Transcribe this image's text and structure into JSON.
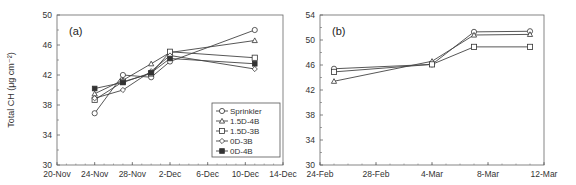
{
  "chart_data": [
    {
      "type": "line",
      "panel_label": "(a)",
      "title": "",
      "xlabel": "",
      "ylabel": "Total CH (μg cm⁻²)",
      "ylim": [
        30,
        50
      ],
      "yticks": [
        30,
        34,
        38,
        42,
        46,
        50
      ],
      "xtick_labels": [
        "20-Nov",
        "24-Nov",
        "28-Nov",
        "2-Dec",
        "6-Dec",
        "10-Dec",
        "14-Dec"
      ],
      "x_range_days": [
        0,
        24
      ],
      "x": [
        "24-Nov",
        "27-Nov",
        "1-Dec",
        "2-Dec",
        "11-Dec"
      ],
      "x_days": [
        4,
        7,
        10,
        12,
        21
      ],
      "grid": false,
      "legend_position": "lower right",
      "series": [
        {
          "name": "Sprinkler",
          "marker": "circle",
          "values": [
            36.9,
            42.0,
            41.7,
            43.8,
            48.0
          ]
        },
        {
          "name": "1.5D-4B",
          "marker": "triangle",
          "values": [
            39.5,
            41.3,
            43.5,
            45.0,
            46.6
          ]
        },
        {
          "name": "1.5D-3B",
          "marker": "square",
          "values": [
            38.7,
            41.1,
            42.2,
            45.1,
            44.3
          ]
        },
        {
          "name": "0D-3B",
          "marker": "diamond",
          "values": [
            38.9,
            40.0,
            42.5,
            44.6,
            42.8
          ]
        },
        {
          "name": "0D-4B",
          "marker": "filled-square",
          "values": [
            40.2,
            41.0,
            42.3,
            44.2,
            43.5
          ]
        }
      ]
    },
    {
      "type": "line",
      "panel_label": "(b)",
      "title": "",
      "xlabel": "",
      "ylabel": "",
      "ylim": [
        30,
        54
      ],
      "yticks": [
        30,
        34,
        38,
        42,
        46,
        50,
        54
      ],
      "xtick_labels": [
        "24-Feb",
        "28-Feb",
        "4-Mar",
        "8-Mar",
        "12-Mar"
      ],
      "x_range_days": [
        0,
        16
      ],
      "x": [
        "25-Feb",
        "4-Mar",
        "7-Mar",
        "11-Mar"
      ],
      "x_days": [
        1,
        8,
        11,
        15
      ],
      "grid": false,
      "legend_position": "none",
      "series": [
        {
          "name": "Sprinkler",
          "marker": "circle",
          "values": [
            45.4,
            46.1,
            51.3,
            51.4
          ]
        },
        {
          "name": "1.5D-4B",
          "marker": "triangle",
          "values": [
            43.4,
            46.6,
            50.8,
            50.9
          ]
        },
        {
          "name": "1.5D-3B",
          "marker": "square",
          "values": [
            44.9,
            46.1,
            48.9,
            48.9
          ]
        }
      ]
    }
  ]
}
